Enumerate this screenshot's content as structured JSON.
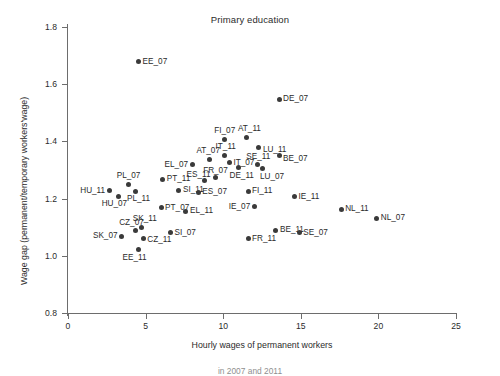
{
  "chart_data": {
    "type": "scatter",
    "title": "Primary education",
    "xlabel": "Hourly wages of permanent workers",
    "ylabel": "Wage gap (permanent/temporary workers'wage)",
    "xlim": [
      0,
      25
    ],
    "ylim": [
      0.8,
      1.8
    ],
    "xticks": [
      0,
      5,
      10,
      15,
      20,
      25
    ],
    "yticks": [
      "0.8",
      "1.0",
      "1.2",
      "1.4",
      "1.6",
      "1.8"
    ],
    "grid": false,
    "legend": null,
    "marker_color": "#3a3a3a",
    "axis_color": "#6d6d6d",
    "points": [
      {
        "label": "EE_07",
        "x": 4.55,
        "y": 1.679,
        "lx": "right",
        "ldx": 4,
        "ldy": 0
      },
      {
        "label": "DE_07",
        "x": 13.6,
        "y": 1.548,
        "lx": "right",
        "ldx": 4,
        "ldy": 0
      },
      {
        "label": "FI_07",
        "x": 10.1,
        "y": 1.407,
        "lx": "above",
        "ldx": 0,
        "ldy": -4
      },
      {
        "label": "AT_11",
        "x": 11.5,
        "y": 1.415,
        "lx": "above",
        "ldx": 3,
        "ldy": -4
      },
      {
        "label": "LU_11",
        "x": 12.3,
        "y": 1.377,
        "lx": "right",
        "ldx": 4,
        "ldy": 2
      },
      {
        "label": "IT_11",
        "x": 10.1,
        "y": 1.352,
        "lx": "above",
        "ldx": 1,
        "ldy": -4
      },
      {
        "label": "AT_07",
        "x": 9.1,
        "y": 1.338,
        "lx": "above",
        "ldx": -1,
        "ldy": -4
      },
      {
        "label": "IT_07",
        "x": 10.4,
        "y": 1.327,
        "lx": "right",
        "ldx": 4,
        "ldy": 1
      },
      {
        "label": "SE_11",
        "x": 12.2,
        "y": 1.318,
        "lx": "above",
        "ldx": 1,
        "ldy": -4
      },
      {
        "label": "BE_07",
        "x": 13.6,
        "y": 1.352,
        "lx": "right",
        "ldx": 4,
        "ldy": 4
      },
      {
        "label": "EL_07",
        "x": 8.0,
        "y": 1.319,
        "lx": "left",
        "ldx": -4,
        "ldy": 0
      },
      {
        "label": "DE_11",
        "x": 11.0,
        "y": 1.308,
        "lx": "below",
        "ldx": 3,
        "ldy": 4
      },
      {
        "label": "LU_07",
        "x": 12.5,
        "y": 1.305,
        "lx": "below",
        "ldx": 10,
        "ldy": 4
      },
      {
        "label": "FR_07",
        "x": 9.5,
        "y": 1.273,
        "lx": "above",
        "ldx": 0,
        "ldy": -3
      },
      {
        "label": "ES_11",
        "x": 8.8,
        "y": 1.262,
        "lx": "above",
        "ldx": -6,
        "ldy": -2
      },
      {
        "label": "PT_11",
        "x": 6.1,
        "y": 1.268,
        "lx": "right",
        "ldx": 4,
        "ldy": 0
      },
      {
        "label": "PL_07",
        "x": 3.9,
        "y": 1.25,
        "lx": "above",
        "ldx": 0,
        "ldy": -4
      },
      {
        "label": "HU_11",
        "x": 2.65,
        "y": 1.228,
        "lx": "left",
        "ldx": -4,
        "ldy": 0
      },
      {
        "label": "PL_11",
        "x": 4.35,
        "y": 1.226,
        "lx": "below",
        "ldx": 3,
        "ldy": 4
      },
      {
        "label": "HU_07",
        "x": 3.25,
        "y": 1.208,
        "lx": "below",
        "ldx": -4,
        "ldy": 4
      },
      {
        "label": "SI_11",
        "x": 7.15,
        "y": 1.229,
        "lx": "right",
        "ldx": 4,
        "ldy": 0
      },
      {
        "label": "ES_07",
        "x": 8.4,
        "y": 1.222,
        "lx": "right",
        "ldx": 4,
        "ldy": 0
      },
      {
        "label": "FI_11",
        "x": 11.6,
        "y": 1.225,
        "lx": "right",
        "ldx": 4,
        "ldy": 0
      },
      {
        "label": "IE_11",
        "x": 14.6,
        "y": 1.206,
        "lx": "right",
        "ldx": 4,
        "ldy": 0
      },
      {
        "label": "NL_11",
        "x": 17.6,
        "y": 1.163,
        "lx": "right",
        "ldx": 4,
        "ldy": 0
      },
      {
        "label": "NL_07",
        "x": 19.9,
        "y": 1.131,
        "lx": "right",
        "ldx": 4,
        "ldy": 0
      },
      {
        "label": "PT_07",
        "x": 6.0,
        "y": 1.168,
        "lx": "right",
        "ldx": 4,
        "ldy": 0
      },
      {
        "label": "EL_11",
        "x": 7.6,
        "y": 1.155,
        "lx": "right",
        "ldx": 4,
        "ldy": 0
      },
      {
        "label": "IE_07",
        "x": 12.0,
        "y": 1.172,
        "lx": "left",
        "ldx": -4,
        "ldy": 0
      },
      {
        "label": "SK_11",
        "x": 4.75,
        "y": 1.1,
        "lx": "above",
        "ldx": 3,
        "ldy": -4
      },
      {
        "label": "CZ_07",
        "x": 4.35,
        "y": 1.088,
        "lx": "above",
        "ldx": -4,
        "ldy": -4
      },
      {
        "label": "SK_07",
        "x": 3.45,
        "y": 1.068,
        "lx": "left",
        "ldx": -4,
        "ldy": 0
      },
      {
        "label": "CZ_11",
        "x": 4.85,
        "y": 1.062,
        "lx": "right",
        "ldx": 4,
        "ldy": 2
      },
      {
        "label": "SI_07",
        "x": 6.6,
        "y": 1.081,
        "lx": "right",
        "ldx": 4,
        "ldy": 0
      },
      {
        "label": "BE_11",
        "x": 13.4,
        "y": 1.09,
        "lx": "right",
        "ldx": 4,
        "ldy": 0
      },
      {
        "label": "FR_11",
        "x": 11.6,
        "y": 1.06,
        "lx": "right",
        "ldx": 4,
        "ldy": 0
      },
      {
        "label": "EE_11",
        "x": 4.55,
        "y": 1.021,
        "lx": "below",
        "ldx": -4,
        "ldy": 4
      },
      {
        "label": "SE_07",
        "x": 14.9,
        "y": 1.08,
        "lx": "right",
        "ldx": 4,
        "ldy": 0
      }
    ]
  },
  "caption": "in 2007 and 2011"
}
